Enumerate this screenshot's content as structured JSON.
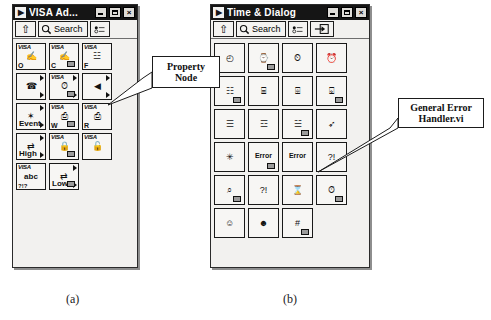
{
  "page": {
    "background": "#ffffff",
    "caption_a": "(a)",
    "caption_b": "(b)"
  },
  "callouts": [
    {
      "id": "property-node",
      "line1": "Property",
      "line2": "Node"
    },
    {
      "id": "general-error-handler",
      "line1": "General Error",
      "line2": "Handler.vi"
    }
  ],
  "window_a": {
    "title": "VISA Ad...",
    "logo": "▶",
    "buttons": {
      "minimize": "minimize-icon",
      "maximize": "maximize-icon",
      "close": "×"
    },
    "toolbar": {
      "up_label": "⇧",
      "search_label": "Search",
      "search_icon": "magnifier-icon",
      "options_icon": "options-icon"
    },
    "grid_columns": 3,
    "icons": [
      {
        "name": "visa-open",
        "tag": "VISA",
        "corner": "O",
        "glyph": "✍"
      },
      {
        "name": "visa-close",
        "tag": "VISA",
        "corner": "C",
        "glyph": "✍"
      },
      {
        "name": "visa-find-resource",
        "tag": "VISA",
        "corner": "F",
        "glyph": "☳"
      },
      {
        "name": "visa-serial-sub",
        "tag": "",
        "corner": "",
        "glyph": "☎",
        "submenu": true
      },
      {
        "name": "visa-clock-sub",
        "tag": "VISA",
        "corner": "",
        "glyph": "⏱",
        "submenu": true
      },
      {
        "name": "property-node-icon",
        "tag": "",
        "corner": "",
        "glyph": "◀",
        "submenu": true
      },
      {
        "name": "event-sub",
        "tag": "",
        "corner": "",
        "glyph": "✶",
        "word": "Event",
        "submenu": true
      },
      {
        "name": "visa-write",
        "tag": "VISA",
        "corner": "W",
        "glyph": "⎙"
      },
      {
        "name": "visa-read",
        "tag": "VISA",
        "corner": "R",
        "glyph": "⎙"
      },
      {
        "name": "high-level-sub",
        "tag": "",
        "corner": "",
        "glyph": "⇄",
        "word": "High",
        "submenu": true
      },
      {
        "name": "visa-lock",
        "tag": "VISA",
        "corner": "",
        "glyph": "🔒"
      },
      {
        "name": "visa-unlock",
        "tag": "VISA",
        "corner": "",
        "glyph": "🔓"
      },
      {
        "name": "visa-string",
        "tag": "VISA",
        "corner": "",
        "glyph": "abc",
        "sub2": "?!?"
      },
      {
        "name": "low-level-sub",
        "tag": "",
        "corner": "",
        "glyph": "⇄",
        "word": "Low",
        "submenu": true
      }
    ]
  },
  "window_b": {
    "title": "Time & Dialog",
    "logo": "▶",
    "buttons": {
      "minimize": "minimize-icon",
      "maximize": "maximize-icon",
      "close": "×"
    },
    "toolbar": {
      "up_label": "⇧",
      "search_label": "Search",
      "search_icon": "magnifier-icon",
      "options_icon": "options-icon",
      "extra_icon": "detach-icon"
    },
    "grid_columns": 4,
    "icons": [
      {
        "name": "tick-count",
        "glyph": "◴"
      },
      {
        "name": "wait-ms",
        "glyph": "⌚"
      },
      {
        "name": "wait-ms-multiple",
        "glyph": "⏲"
      },
      {
        "name": "get-date-time-string",
        "glyph": "⏰"
      },
      {
        "name": "format-date-time",
        "glyph": "☷"
      },
      {
        "name": "to-date-time-rec",
        "glyph": "⌸"
      },
      {
        "name": "seconds-to-date-time",
        "glyph": "⌹"
      },
      {
        "name": "date-time-to-seconds",
        "glyph": "⌺"
      },
      {
        "name": "one-button-dialog",
        "glyph": "☰"
      },
      {
        "name": "two-button-dialog",
        "glyph": "☲"
      },
      {
        "name": "three-button-dialog",
        "glyph": "☱"
      },
      {
        "name": "wait-for-front-panel",
        "glyph": "➶"
      },
      {
        "name": "beep",
        "glyph": "✳"
      },
      {
        "name": "simple-error-handler",
        "glyph": "Error"
      },
      {
        "name": "general-error-handler-icon",
        "glyph": "Error"
      },
      {
        "name": "find-first-error",
        "glyph": "?!"
      },
      {
        "name": "error-cluster-lookup",
        "glyph": "⌕"
      },
      {
        "name": "merge-errors",
        "glyph": "?!"
      },
      {
        "name": "clear-errors",
        "glyph": "⌛"
      },
      {
        "name": "error-timeout",
        "glyph": "⏱"
      },
      {
        "name": "prompt-user-input",
        "glyph": "☺"
      },
      {
        "name": "display-message",
        "glyph": "☻"
      },
      {
        "name": "error-code-convert",
        "glyph": "#"
      }
    ]
  }
}
